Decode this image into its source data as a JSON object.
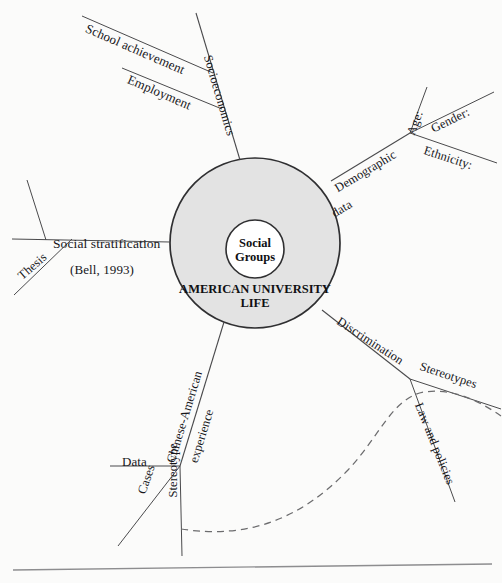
{
  "diagram": {
    "type": "mind-map",
    "background_color": "#fbfbfa",
    "circle_fill_color": "#e3e3e3",
    "stroke_color": "#3a3a3c",
    "core": {
      "inner_label": "Social\nGroups",
      "outer_label": "AMERICAN UNIVERSITY\nLIFE"
    },
    "branches": [
      {
        "id": "socioeconomics",
        "label": "Socioeconomics",
        "angle": -65,
        "children": [
          {
            "id": "school-achievement",
            "label": "School achievement",
            "angle": -24
          },
          {
            "id": "employment",
            "label": "Employment",
            "angle": -24
          }
        ]
      },
      {
        "id": "demographic-data",
        "label": "Demographic\ndata",
        "label_line1": "Demographic",
        "label_line2": "data",
        "angle": -31,
        "children": [
          {
            "id": "age",
            "label": "Age:",
            "angle": -66
          },
          {
            "id": "gender",
            "label": "Gender:",
            "angle": -33
          },
          {
            "id": "ethnicity",
            "label": "Ethnicity:",
            "angle": 17
          }
        ]
      },
      {
        "id": "discrimination",
        "label": "Discrimination",
        "angle": 29,
        "children": [
          {
            "id": "stereotypes",
            "label": "Stereotypes",
            "angle": 17
          },
          {
            "id": "law-and-policies",
            "label": "Law and policies",
            "angle": 68
          }
        ]
      },
      {
        "id": "chinese-american-experience",
        "label": "Chinese-American\nexperience",
        "label_line1": "Chinese-American",
        "label_line2": "experience",
        "angle": 62,
        "children": [
          {
            "id": "data",
            "label": "Data",
            "angle": 0
          },
          {
            "id": "cases",
            "label": "Cases",
            "angle": 71
          },
          {
            "id": "stereotype",
            "label": "Stereotype",
            "angle": 90
          }
        ]
      },
      {
        "id": "social-stratification",
        "label": "Social stratification",
        "sublabel": "(Bell, 1993)",
        "angle": 180,
        "children": [
          {
            "id": "thesis",
            "label": "Thesis",
            "angle": 33
          }
        ]
      }
    ],
    "dashed_curve": {
      "id": "dashed-s-curve",
      "style": "dashed"
    },
    "footer_rule": {
      "id": "footer-rule"
    }
  }
}
